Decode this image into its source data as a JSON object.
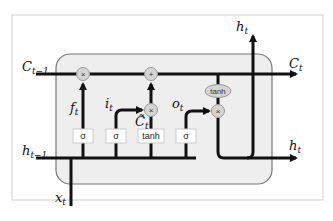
{
  "diagram": {
    "inputs": {
      "cell_state_prev": {
        "base": "C",
        "sub": "t−1"
      },
      "hidden_prev": {
        "base": "h",
        "sub": "t−1"
      },
      "input": {
        "base": "x",
        "sub": "t"
      }
    },
    "outputs": {
      "cell_state": {
        "base": "C",
        "sub": "t"
      },
      "hidden_top": {
        "base": "h",
        "sub": "t"
      },
      "hidden_right": {
        "base": "h",
        "sub": "t"
      }
    },
    "gates": {
      "forget": {
        "base": "f",
        "sub": "t",
        "activation": "σ"
      },
      "input": {
        "base": "i",
        "sub": "t",
        "activation": "σ"
      },
      "candidate": {
        "base": "C̃",
        "sub": "t",
        "activation": "tanh"
      },
      "output": {
        "base": "o",
        "sub": "t",
        "activation": "σ"
      }
    },
    "operations": {
      "forget_mult": "×",
      "add": "+",
      "input_mult": "×",
      "output_mult": "×",
      "output_tanh": "tanh"
    },
    "colors": {
      "cell_fill": "#eeeeee",
      "cell_border": "#777777",
      "line": "#111111",
      "op_fill": "#d4d4d4",
      "box_fill": "#ffffff",
      "frame": "#cccccc"
    }
  }
}
